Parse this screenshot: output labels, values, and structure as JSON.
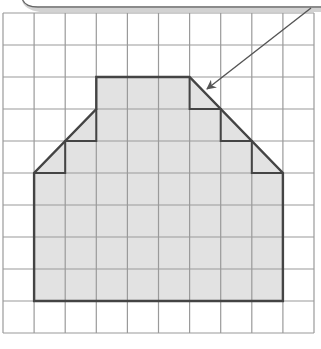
{
  "figure": {
    "grid": {
      "columns": 10,
      "rows": 10,
      "origin_px": [
        3,
        13
      ],
      "cell_w_px": 31.1,
      "cell_h_px": 32,
      "line_color": "#9a9a9a",
      "inner_line_color": "#777777"
    },
    "shape": {
      "vertices_grid": [
        [
          3,
          2
        ],
        [
          6,
          2
        ],
        [
          9,
          5
        ],
        [
          9,
          9
        ],
        [
          1,
          9
        ],
        [
          1,
          5
        ],
        [
          3,
          3
        ],
        [
          3,
          2
        ]
      ],
      "fill_color": "#e2e2e2",
      "outline_color": "#444444",
      "full_squares": 47,
      "half_squares": 5
    },
    "staircases": {
      "right": [
        [
          6,
          2
        ],
        [
          6,
          3
        ],
        [
          7,
          3
        ],
        [
          7,
          4
        ],
        [
          8,
          4
        ],
        [
          8,
          5
        ],
        [
          9,
          5
        ]
      ],
      "left": [
        [
          3,
          3
        ],
        [
          3,
          4
        ],
        [
          2,
          4
        ],
        [
          2,
          5
        ],
        [
          1,
          5
        ]
      ]
    },
    "callout": {
      "arrow_from_px": [
        311,
        8
      ],
      "arrow_to_px": [
        207,
        89
      ],
      "arrow_color": "#555555",
      "bubble_fill": "#ffffff",
      "bubble_shadow": "#cfcfcf"
    }
  }
}
